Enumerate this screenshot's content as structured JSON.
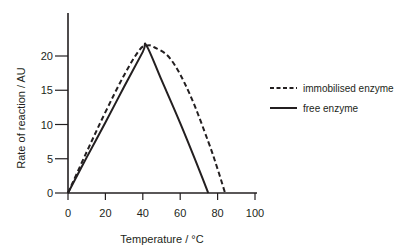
{
  "chart_data": {
    "type": "line",
    "title": "",
    "xlabel": "Temperature / °C",
    "ylabel": "Rate of reaction / AU",
    "xlim": [
      0,
      100
    ],
    "ylim": [
      0,
      23
    ],
    "xticks": [
      0,
      20,
      40,
      60,
      80,
      100
    ],
    "yticks": [
      0,
      5,
      10,
      15,
      20
    ],
    "grid": false,
    "legend_position": "right",
    "series": [
      {
        "name": "immobilised enzyme",
        "style": "dashed",
        "x": [
          0,
          10,
          20,
          30,
          38,
          42,
          46,
          55,
          65,
          75,
          80,
          84
        ],
        "y": [
          0,
          6.0,
          11.8,
          17.2,
          20.8,
          21.5,
          21.3,
          19.5,
          14.5,
          7.5,
          3.5,
          0
        ]
      },
      {
        "name": "free enzyme",
        "style": "solid",
        "x": [
          0,
          10,
          20,
          30,
          40,
          42,
          50,
          60,
          70,
          75
        ],
        "y": [
          0,
          5.2,
          10.3,
          15.5,
          20.6,
          21.5,
          16.5,
          10.2,
          3.5,
          0
        ]
      }
    ]
  },
  "legend": {
    "items": [
      {
        "label": "immobilised enzyme",
        "style": "dashed"
      },
      {
        "label": "free enzyme",
        "style": "solid"
      }
    ]
  },
  "colors": {
    "line": "#231f20",
    "axis": "#231f20"
  }
}
